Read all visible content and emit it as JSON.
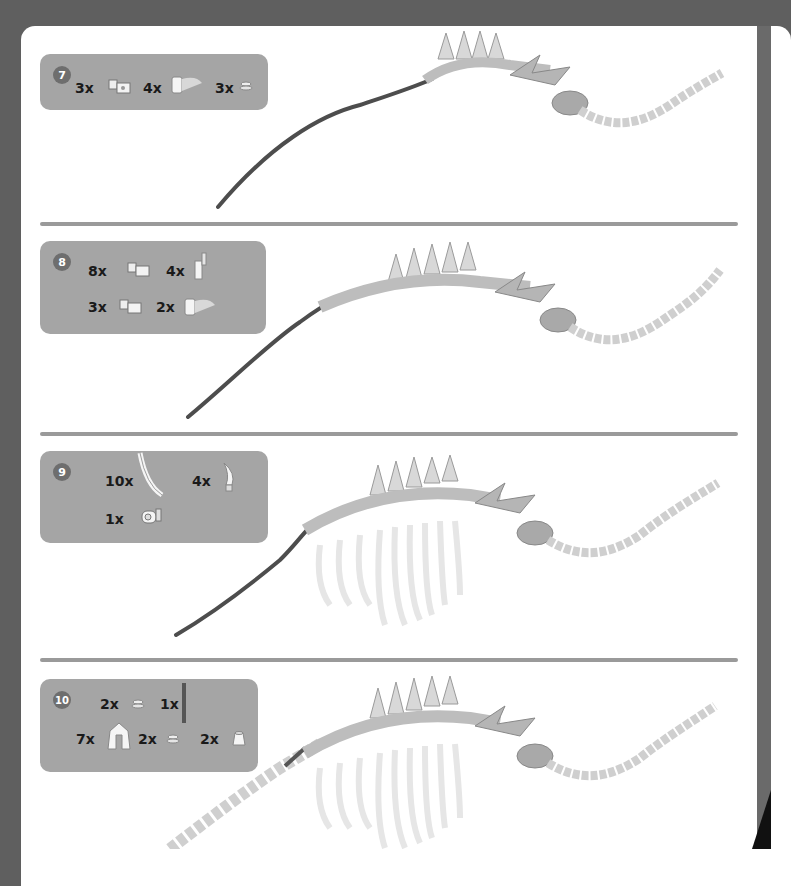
{
  "steps": [
    {
      "number": "7",
      "parts": [
        {
          "qty": "3x",
          "icon": "axle-connector-block-icon"
        },
        {
          "qty": "4x",
          "icon": "curved-slope-piece-icon"
        },
        {
          "qty": "3x",
          "icon": "round-plate-stack-icon"
        }
      ]
    },
    {
      "number": "8",
      "parts": [
        {
          "qty": "8x",
          "icon": "axle-connector-block-icon"
        },
        {
          "qty": "4x",
          "icon": "bar-connector-icon"
        },
        {
          "qty": "3x",
          "icon": "axle-connector-block-icon"
        },
        {
          "qty": "2x",
          "icon": "curved-slope-piece-icon"
        }
      ]
    },
    {
      "number": "9",
      "parts": [
        {
          "qty": "10x",
          "icon": "long-curved-rib-icon"
        },
        {
          "qty": "4x",
          "icon": "horn-tooth-icon"
        },
        {
          "qty": "1x",
          "icon": "pin-connector-icon"
        }
      ]
    },
    {
      "number": "10",
      "parts": [
        {
          "qty": "2x",
          "icon": "round-plate-stack-icon"
        },
        {
          "qty": "1x",
          "icon": "dark-axle-rod-icon"
        },
        {
          "qty": "7x",
          "icon": "cape-slope-piece-icon"
        },
        {
          "qty": "2x",
          "icon": "round-plate-stack-icon"
        },
        {
          "qty": "2x",
          "icon": "cone-brick-icon"
        }
      ]
    }
  ],
  "colors": {
    "background": "#5f5f5f",
    "page": "#ffffff",
    "panel": "#a5a5a5",
    "badge": "#6e6e6e",
    "divider": "#9a9a9a",
    "skeleton": "#d8d8d8",
    "spine_rod": "#5a5a5a"
  }
}
